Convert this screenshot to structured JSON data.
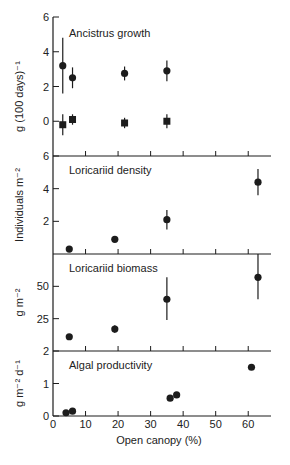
{
  "x_axis": {
    "label": "Open canopy (%)",
    "ticks": [
      0,
      10,
      20,
      30,
      40,
      50,
      60
    ],
    "range": [
      0,
      67
    ]
  },
  "chart_data": [
    {
      "type": "scatter",
      "title": "Ancistrus growth",
      "xlabel": "Open canopy (%)",
      "ylabel": "g (100 days)⁻¹",
      "ylim": [
        -2,
        6
      ],
      "yticks": [
        0,
        2,
        4,
        6
      ],
      "series": [
        {
          "name": "circles",
          "marker": "circle",
          "points": [
            {
              "x": 3,
              "y": 3.2,
              "err_lo": 1.6,
              "err_hi": 4.8
            },
            {
              "x": 6,
              "y": 2.5,
              "err_lo": 1.9,
              "err_hi": 3.1
            },
            {
              "x": 22,
              "y": 2.75,
              "err_lo": 2.35,
              "err_hi": 3.15
            },
            {
              "x": 35,
              "y": 2.9,
              "err_lo": 2.3,
              "err_hi": 3.5
            }
          ]
        },
        {
          "name": "squares",
          "marker": "square",
          "points": [
            {
              "x": 3,
              "y": -0.2,
              "err_lo": -0.8,
              "err_hi": 0.4
            },
            {
              "x": 6,
              "y": 0.1,
              "err_lo": -0.2,
              "err_hi": 0.4
            },
            {
              "x": 22,
              "y": -0.1,
              "err_lo": -0.4,
              "err_hi": 0.2
            },
            {
              "x": 35,
              "y": 0.0,
              "err_lo": -0.4,
              "err_hi": 0.4
            }
          ]
        }
      ]
    },
    {
      "type": "scatter",
      "title": "Loricariid density",
      "xlabel": "Open canopy (%)",
      "ylabel": "Individuals m⁻²",
      "ylim": [
        0,
        6
      ],
      "yticks": [
        2,
        4,
        6
      ],
      "series": [
        {
          "name": "density",
          "marker": "circle",
          "points": [
            {
              "x": 5,
              "y": 0.3
            },
            {
              "x": 19,
              "y": 0.9
            },
            {
              "x": 35,
              "y": 2.1,
              "err_lo": 1.5,
              "err_hi": 2.7
            },
            {
              "x": 63,
              "y": 4.4,
              "err_lo": 3.6,
              "err_hi": 5.2
            }
          ]
        }
      ]
    },
    {
      "type": "scatter",
      "title": "Loricariid biomass",
      "xlabel": "Open canopy (%)",
      "ylabel": "g m⁻²",
      "ylim": [
        0,
        75
      ],
      "yticks": [
        25,
        50
      ],
      "series": [
        {
          "name": "biomass",
          "marker": "circle",
          "points": [
            {
              "x": 5,
              "y": 11
            },
            {
              "x": 19,
              "y": 17,
              "err_lo": 14,
              "err_hi": 20
            },
            {
              "x": 35,
              "y": 40,
              "err_lo": 24,
              "err_hi": 57
            },
            {
              "x": 63,
              "y": 57,
              "err_lo": 40,
              "err_hi": 75
            }
          ]
        }
      ]
    },
    {
      "type": "scatter",
      "title": "Algal productivity",
      "xlabel": "Open canopy (%)",
      "ylabel": "g m⁻² d⁻¹",
      "ylim": [
        0,
        2
      ],
      "yticks": [
        0,
        1,
        2
      ],
      "series": [
        {
          "name": "productivity",
          "marker": "circle",
          "points": [
            {
              "x": 4,
              "y": 0.1
            },
            {
              "x": 6,
              "y": 0.15
            },
            {
              "x": 36,
              "y": 0.55
            },
            {
              "x": 38,
              "y": 0.65
            },
            {
              "x": 61,
              "y": 1.5
            }
          ]
        }
      ]
    }
  ]
}
